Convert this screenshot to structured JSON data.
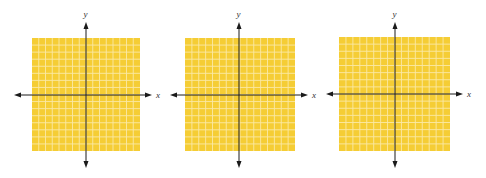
{
  "colors": {
    "grid_fill": "#F5CD35",
    "grid_line": "#FBE9A6",
    "axis": "#1a1a1a",
    "background": "#ffffff"
  },
  "grids": [
    {
      "x_label": "x",
      "y_label": "y",
      "bounds": {
        "left": 32,
        "top": 38,
        "right": 140,
        "bottom": 151
      },
      "origin": {
        "x": 86,
        "y": 95
      },
      "x_axis": {
        "from": 14,
        "to": 152
      },
      "y_axis": {
        "from": 22,
        "to": 168
      },
      "cells": 16
    },
    {
      "x_label": "x",
      "y_label": "y",
      "bounds": {
        "left": 185,
        "top": 38,
        "right": 295,
        "bottom": 151
      },
      "origin": {
        "x": 239,
        "y": 95
      },
      "x_axis": {
        "from": 170,
        "to": 308
      },
      "y_axis": {
        "from": 22,
        "to": 168
      },
      "cells": 16
    },
    {
      "x_label": "x",
      "y_label": "y",
      "bounds": {
        "left": 339,
        "top": 37,
        "right": 450,
        "bottom": 151
      },
      "origin": {
        "x": 395,
        "y": 94
      },
      "x_axis": {
        "from": 326,
        "to": 463
      },
      "y_axis": {
        "from": 22,
        "to": 168
      },
      "cells": 16
    }
  ]
}
